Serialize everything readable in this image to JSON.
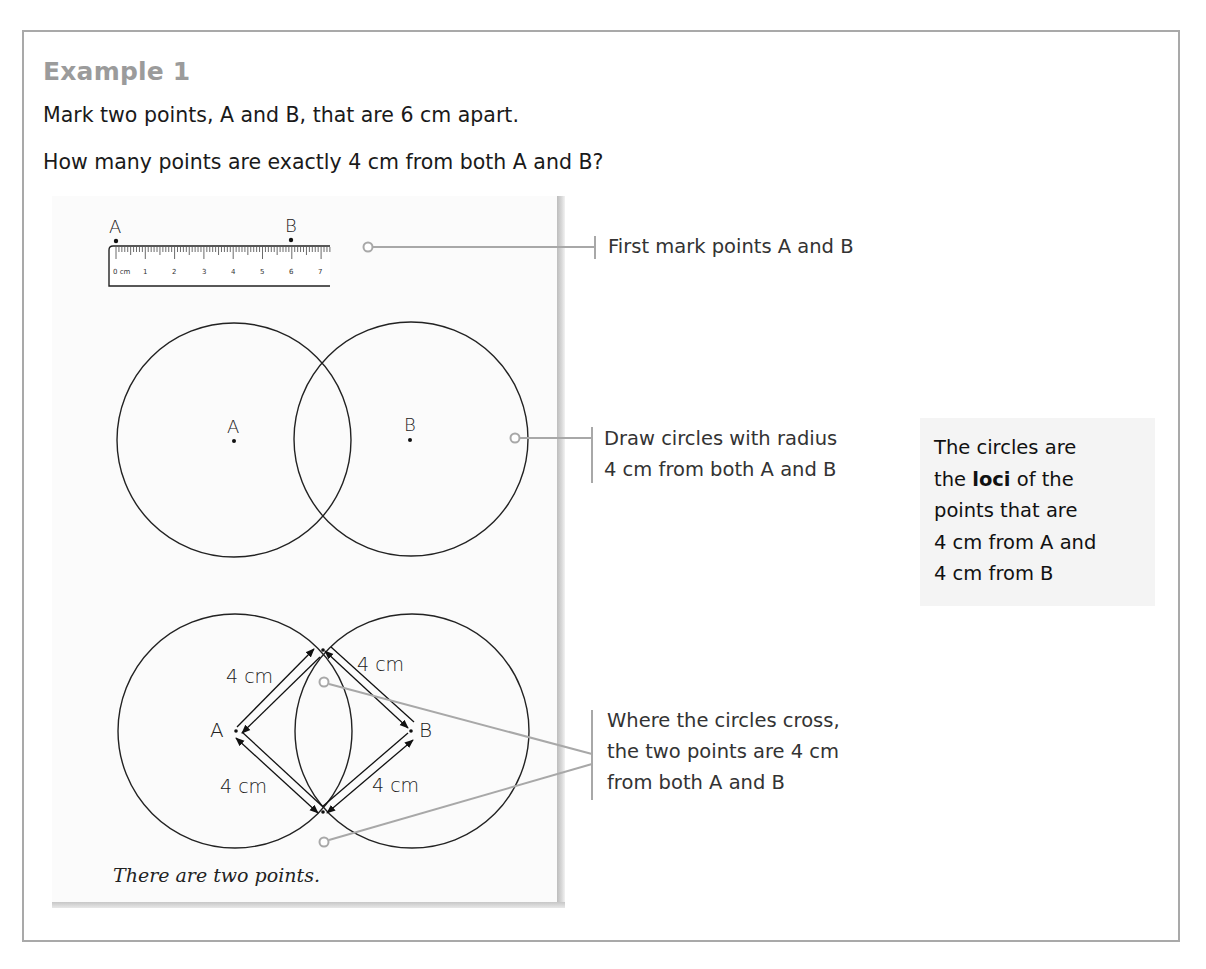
{
  "example": {
    "title": "Example 1",
    "question_line_1": "Mark two points, A and B, that are 6 cm apart.",
    "question_line_2": "How many points are exactly 4 cm from both A and B?"
  },
  "diagram": {
    "ruler": {
      "point_a_label": "A",
      "point_b_label": "B",
      "tick_labels": [
        "0 cm",
        "1",
        "2",
        "3",
        "4",
        "5",
        "6",
        "7"
      ]
    },
    "step2": {
      "center_a_label": "A",
      "center_b_label": "B",
      "radius_cm": 4
    },
    "step3": {
      "point_a_label": "A",
      "point_b_label": "B",
      "distance_labels": [
        "4 cm",
        "4 cm",
        "4 cm",
        "4 cm"
      ]
    },
    "answer": "There are two points."
  },
  "callouts": [
    {
      "lines": [
        "First mark points A and B"
      ]
    },
    {
      "lines": [
        "Draw circles with radius",
        "4 cm from both A and B"
      ]
    },
    {
      "lines": [
        "Where the circles cross,",
        "the two points are 4 cm",
        "from both A and B"
      ]
    }
  ],
  "note": {
    "line_1": "The circles are",
    "line_2_pre": "the ",
    "line_2_bold": "loci",
    "line_2_post": " of the",
    "line_3": "points that are",
    "line_4": "4 cm from A and",
    "line_5": "4 cm from B"
  },
  "colors": {
    "frame": "#a9a9a9",
    "title": "#9b9b9b",
    "leader": "#a8a8a8",
    "note_bg": "#f4f4f4"
  }
}
